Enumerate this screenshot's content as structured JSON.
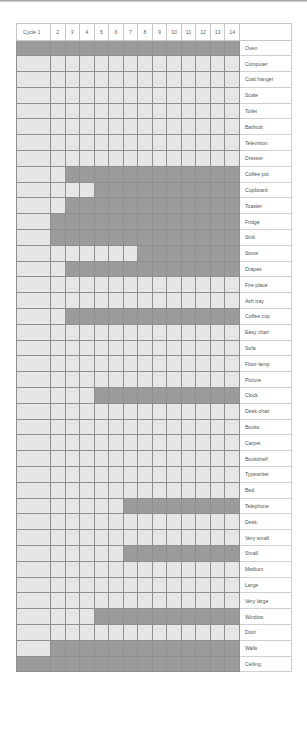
{
  "chart_data": {
    "type": "heatmap",
    "title": "",
    "xlabel": "Cycle",
    "ylabel": "",
    "columns": [
      "Cycle 1",
      "2",
      "3",
      "4",
      "5",
      "6",
      "7",
      "8",
      "9",
      "10",
      "11",
      "12",
      "13",
      "14"
    ],
    "x": [
      1,
      2,
      3,
      4,
      5,
      6,
      7,
      8,
      9,
      10,
      11,
      12,
      13,
      14
    ],
    "legend": {
      "dark": "active / shaded",
      "light": "inactive"
    },
    "colors": {
      "active": "#9b9b9b",
      "inactive": "#e6e6e6",
      "grid": "#8f8f8f"
    },
    "rows": [
      {
        "label": "Oven",
        "active_from_cycle": 1
      },
      {
        "label": "Computer",
        "active_from_cycle": 0
      },
      {
        "label": "Coat hanger",
        "active_from_cycle": 0
      },
      {
        "label": "Scale",
        "active_from_cycle": 0
      },
      {
        "label": "Toilet",
        "active_from_cycle": 0
      },
      {
        "label": "Bathtub",
        "active_from_cycle": 0
      },
      {
        "label": "Television",
        "active_from_cycle": 0
      },
      {
        "label": "Dresser",
        "active_from_cycle": 0
      },
      {
        "label": "Coffee pot",
        "active_from_cycle": 3
      },
      {
        "label": "Cupboard",
        "active_from_cycle": 5
      },
      {
        "label": "Toaster",
        "active_from_cycle": 3
      },
      {
        "label": "Fridge",
        "active_from_cycle": 2
      },
      {
        "label": "Sink",
        "active_from_cycle": 2
      },
      {
        "label": "Stove",
        "active_from_cycle": 8
      },
      {
        "label": "Drapes",
        "active_from_cycle": 3
      },
      {
        "label": "Fire place",
        "active_from_cycle": 0
      },
      {
        "label": "Ash tray",
        "active_from_cycle": 0
      },
      {
        "label": "Coffee cup",
        "active_from_cycle": 3
      },
      {
        "label": "Easy chair",
        "active_from_cycle": 0
      },
      {
        "label": "Sofa",
        "active_from_cycle": 0
      },
      {
        "label": "Floor-lamp",
        "active_from_cycle": 0
      },
      {
        "label": "Picture",
        "active_from_cycle": 0
      },
      {
        "label": "Clock",
        "active_from_cycle": 5
      },
      {
        "label": "Desk-chair",
        "active_from_cycle": 0
      },
      {
        "label": "Books",
        "active_from_cycle": 0
      },
      {
        "label": "Carpet",
        "active_from_cycle": 0
      },
      {
        "label": "Bookshelf",
        "active_from_cycle": 0
      },
      {
        "label": "Typewriter",
        "active_from_cycle": 0
      },
      {
        "label": "Bed",
        "active_from_cycle": 0
      },
      {
        "label": "Telephone",
        "active_from_cycle": 7
      },
      {
        "label": "Desk",
        "active_from_cycle": 0
      },
      {
        "label": "Very small",
        "active_from_cycle": 0
      },
      {
        "label": "Small",
        "active_from_cycle": 7
      },
      {
        "label": "Medium",
        "active_from_cycle": 0
      },
      {
        "label": "Large",
        "active_from_cycle": 0
      },
      {
        "label": "Very large",
        "active_from_cycle": 0
      },
      {
        "label": "Window",
        "active_from_cycle": 5
      },
      {
        "label": "Door",
        "active_from_cycle": 0
      },
      {
        "label": "Walls",
        "active_from_cycle": 2
      },
      {
        "label": "Ceiling",
        "active_from_cycle": 1
      }
    ]
  }
}
